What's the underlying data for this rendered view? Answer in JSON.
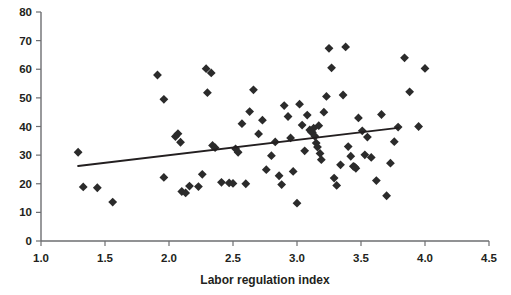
{
  "chart_data": {
    "type": "scatter",
    "title": "",
    "xlabel": "Labor regulation index",
    "ylabel": "",
    "xlim": [
      1.0,
      4.5
    ],
    "ylim": [
      0,
      80
    ],
    "xticks": [
      "1.0",
      "1.5",
      "2.0",
      "2.5",
      "3.0",
      "3.5",
      "4.0",
      "4.5"
    ],
    "xtick_values": [
      1.0,
      1.5,
      2.0,
      2.5,
      3.0,
      3.5,
      4.0,
      4.5
    ],
    "yticks": [
      "0",
      "10",
      "20",
      "30",
      "40",
      "50",
      "60",
      "70",
      "80"
    ],
    "ytick_values": [
      0,
      10,
      20,
      30,
      40,
      50,
      60,
      70,
      80
    ],
    "grid": false,
    "legend": null,
    "marker": "diamond",
    "marker_color": "#2b2b2b",
    "points": [
      [
        1.29,
        31.0
      ],
      [
        1.33,
        18.9
      ],
      [
        1.44,
        18.6
      ],
      [
        1.56,
        13.6
      ],
      [
        1.91,
        58.0
      ],
      [
        1.96,
        49.5
      ],
      [
        1.96,
        22.2
      ],
      [
        2.05,
        36.5
      ],
      [
        2.07,
        37.5
      ],
      [
        2.09,
        34.5
      ],
      [
        2.1,
        17.3
      ],
      [
        2.13,
        16.8
      ],
      [
        2.16,
        19.2
      ],
      [
        2.23,
        19.0
      ],
      [
        2.26,
        23.3
      ],
      [
        2.29,
        60.2
      ],
      [
        2.3,
        51.8
      ],
      [
        2.33,
        58.7
      ],
      [
        2.34,
        33.4
      ],
      [
        2.36,
        32.6
      ],
      [
        2.41,
        20.5
      ],
      [
        2.47,
        20.3
      ],
      [
        2.5,
        20.1
      ],
      [
        2.52,
        32.2
      ],
      [
        2.54,
        31.0
      ],
      [
        2.57,
        41.0
      ],
      [
        2.6,
        20.0
      ],
      [
        2.63,
        45.2
      ],
      [
        2.66,
        52.8
      ],
      [
        2.7,
        37.4
      ],
      [
        2.73,
        42.2
      ],
      [
        2.76,
        24.9
      ],
      [
        2.8,
        29.8
      ],
      [
        2.83,
        34.6
      ],
      [
        2.86,
        22.8
      ],
      [
        2.88,
        19.7
      ],
      [
        2.9,
        47.3
      ],
      [
        2.93,
        43.5
      ],
      [
        2.95,
        36.0
      ],
      [
        2.97,
        24.3
      ],
      [
        3.0,
        13.2
      ],
      [
        3.02,
        47.8
      ],
      [
        3.04,
        40.5
      ],
      [
        3.06,
        31.5
      ],
      [
        3.08,
        44.0
      ],
      [
        3.1,
        38.8
      ],
      [
        3.11,
        38.2
      ],
      [
        3.12,
        37.9
      ],
      [
        3.13,
        39.4
      ],
      [
        3.14,
        36.6
      ],
      [
        3.15,
        34.2
      ],
      [
        3.16,
        32.8
      ],
      [
        3.17,
        40.3
      ],
      [
        3.18,
        30.6
      ],
      [
        3.19,
        28.4
      ],
      [
        3.21,
        45.0
      ],
      [
        3.23,
        50.5
      ],
      [
        3.25,
        67.3
      ],
      [
        3.27,
        60.5
      ],
      [
        3.29,
        22.0
      ],
      [
        3.31,
        19.4
      ],
      [
        3.34,
        26.6
      ],
      [
        3.36,
        51.0
      ],
      [
        3.38,
        67.8
      ],
      [
        3.4,
        33.0
      ],
      [
        3.42,
        29.6
      ],
      [
        3.44,
        26.1
      ],
      [
        3.45,
        25.9
      ],
      [
        3.46,
        25.4
      ],
      [
        3.48,
        43.0
      ],
      [
        3.51,
        38.5
      ],
      [
        3.53,
        30.1
      ],
      [
        3.55,
        36.3
      ],
      [
        3.58,
        29.2
      ],
      [
        3.62,
        21.1
      ],
      [
        3.66,
        44.2
      ],
      [
        3.7,
        15.8
      ],
      [
        3.73,
        27.2
      ],
      [
        3.76,
        34.7
      ],
      [
        3.79,
        39.8
      ],
      [
        3.84,
        64.0
      ],
      [
        3.88,
        52.1
      ],
      [
        3.95,
        40.0
      ],
      [
        4.0,
        60.3
      ]
    ],
    "trend_line": {
      "x": [
        1.29,
        3.79
      ],
      "y": [
        26.2,
        39.5
      ],
      "color": "#231f20"
    }
  }
}
